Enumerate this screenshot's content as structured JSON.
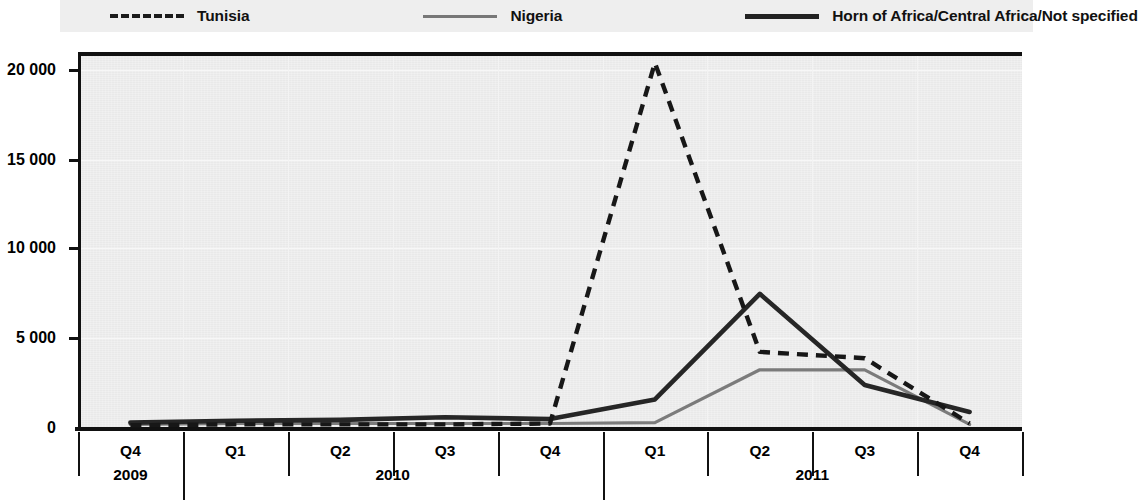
{
  "legend": {
    "items": [
      {
        "label": "Tunisia",
        "style": "dashed",
        "color": "#1b1b1b",
        "icon": "dashed-line-icon"
      },
      {
        "label": "Nigeria",
        "style": "thin-solid",
        "color": "#777777",
        "icon": "thin-line-icon"
      },
      {
        "label": "Horn of Africa/Central Africa/Not specified",
        "style": "thick-solid",
        "color": "#222222",
        "icon": "thick-line-icon"
      }
    ]
  },
  "axes": {
    "y_ticks": [
      "20 000",
      "15 000",
      "10 000",
      "5 000",
      "0"
    ],
    "x_quarters": [
      "Q4",
      "Q1",
      "Q2",
      "Q3",
      "Q4",
      "Q1",
      "Q2",
      "Q3",
      "Q4"
    ],
    "x_years": [
      "2009",
      "2010",
      "2011"
    ]
  },
  "chart_data": {
    "type": "line",
    "title": "",
    "subtitle": "",
    "xlabel": "",
    "ylabel": "",
    "ylim": [
      0,
      21000
    ],
    "yticks": [
      0,
      5000,
      10000,
      15000,
      20000
    ],
    "ytick_labels": [
      "0",
      "5 000",
      "10 000",
      "15 000",
      "20 000"
    ],
    "grid": true,
    "legend_position": "top",
    "categories": [
      "Q4 2009",
      "Q1 2010",
      "Q2 2010",
      "Q3 2010",
      "Q4 2010",
      "Q1 2011",
      "Q2 2011",
      "Q3 2011",
      "Q4 2011"
    ],
    "series": [
      {
        "name": "Tunisia",
        "style": "dashed",
        "color": "#1b1b1b",
        "values": [
          150,
          200,
          200,
          200,
          250,
          20400,
          4250,
          3900,
          250
        ]
      },
      {
        "name": "Nigeria",
        "style": "thin-solid",
        "color": "#777777",
        "values": [
          200,
          250,
          250,
          250,
          250,
          300,
          3250,
          3250,
          200
        ]
      },
      {
        "name": "Horn of Africa/Central Africa/Not specified",
        "style": "thick-solid",
        "color": "#222222",
        "values": [
          300,
          400,
          450,
          600,
          500,
          1600,
          7500,
          2400,
          900
        ]
      }
    ]
  }
}
